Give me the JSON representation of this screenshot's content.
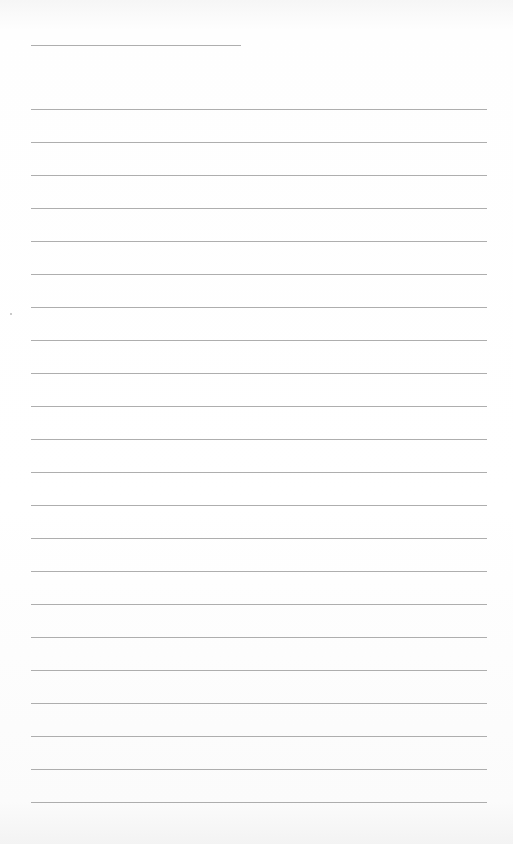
{
  "page": {
    "type": "lined-paper",
    "background_color": "#ffffff",
    "rule_color": "#9a9a9a",
    "header_line": {
      "x_start": 31,
      "x_end": 241,
      "y": 45
    },
    "ruled_lines": {
      "x_start": 31,
      "x_end": 487,
      "first_y": 109,
      "spacing": 33,
      "count": 22
    }
  }
}
